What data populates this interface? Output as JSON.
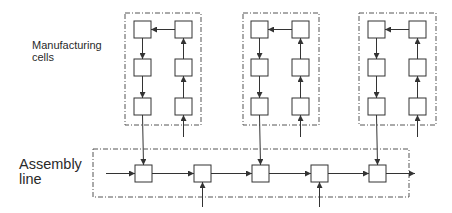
{
  "labels": {
    "manufacturing_cells": "Manufacturing\ncells",
    "assembly_line": "Assembly\nline"
  },
  "colors": {
    "stroke": "#333333",
    "boundary": "#555555",
    "text": "#2a2a2a",
    "background": "#ffffff"
  },
  "cells": [
    {
      "name": "cell-1",
      "boundary": {
        "x": 125,
        "y": 13,
        "w": 76,
        "h": 112
      },
      "left_col_x": 134,
      "right_col_x": 175,
      "rows_y": [
        21,
        59,
        98
      ],
      "input_from_y": 137,
      "output_station_index": 0
    },
    {
      "name": "cell-2",
      "boundary": {
        "x": 243,
        "y": 13,
        "w": 76,
        "h": 112
      },
      "left_col_x": 251,
      "right_col_x": 292,
      "rows_y": [
        21,
        59,
        98
      ],
      "input_from_y": 137,
      "output_station_index": 2
    },
    {
      "name": "cell-3",
      "boundary": {
        "x": 359,
        "y": 13,
        "w": 77,
        "h": 112
      },
      "left_col_x": 368,
      "right_col_x": 409,
      "rows_y": [
        21,
        59,
        98
      ],
      "input_from_y": 137,
      "output_station_index": 4
    }
  ],
  "station_size": 17,
  "assembly": {
    "boundary": {
      "x": 93,
      "y": 149,
      "w": 316,
      "h": 48
    },
    "entry_x": 106,
    "exit_x": 415,
    "station_y": 165,
    "stations_x": [
      135,
      194,
      252,
      311,
      369
    ],
    "external_inputs": [
      {
        "station_index": 1,
        "from_y": 207
      },
      {
        "station_index": 3,
        "from_y": 207
      }
    ]
  }
}
